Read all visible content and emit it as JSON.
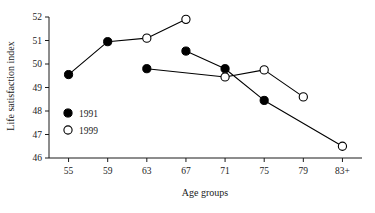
{
  "chart_data": {
    "type": "line",
    "title": "",
    "xlabel": "Age groups",
    "ylabel": "Life satisfaction index",
    "categories": [
      "55",
      "59",
      "63",
      "67",
      "71",
      "75",
      "79",
      "83+"
    ],
    "ylim": [
      46,
      52
    ],
    "yticks": [
      "46",
      "47",
      "48",
      "49",
      "50",
      "51",
      "52"
    ],
    "grid": false,
    "legend_position": "inside-left-lower",
    "series": [
      {
        "name": "1991",
        "marker": "filled-circle",
        "color": "#000000",
        "x": [
          "55",
          "59",
          "63",
          "67",
          "71",
          "75"
        ],
        "values": [
          49.55,
          50.95,
          49.8,
          50.55,
          49.8,
          48.45
        ]
      },
      {
        "name": "1999",
        "marker": "open-circle",
        "color": "#000000",
        "x": [
          "63",
          "67",
          "71",
          "75",
          "79",
          "83+"
        ],
        "values": [
          51.1,
          51.9,
          49.45,
          49.75,
          48.6,
          46.5
        ]
      }
    ],
    "segments": [
      {
        "name": "seg-1991-early",
        "points": [
          [
            "55",
            49.55
          ],
          [
            "59",
            50.95
          ]
        ]
      },
      {
        "name": "seg-1999-rise",
        "points": [
          [
            "59",
            50.95
          ],
          [
            "63",
            51.1
          ],
          [
            "67",
            51.9
          ]
        ]
      },
      {
        "name": "seg-1991-mid",
        "points": [
          [
            "63",
            49.8
          ],
          [
            "71",
            49.45
          ]
        ]
      },
      {
        "name": "seg-1991-late",
        "points": [
          [
            "67",
            50.55
          ],
          [
            "71",
            49.8
          ],
          [
            "75",
            48.45
          ]
        ]
      },
      {
        "name": "seg-1999-late",
        "points": [
          [
            "71",
            49.45
          ],
          [
            "75",
            49.75
          ],
          [
            "79",
            48.6
          ]
        ]
      },
      {
        "name": "seg-tail",
        "points": [
          [
            "75",
            48.45
          ],
          [
            "83+",
            46.5
          ]
        ]
      }
    ],
    "legend": [
      {
        "label": "1991",
        "marker": "filled-circle"
      },
      {
        "label": "1999",
        "marker": "open-circle"
      }
    ]
  }
}
